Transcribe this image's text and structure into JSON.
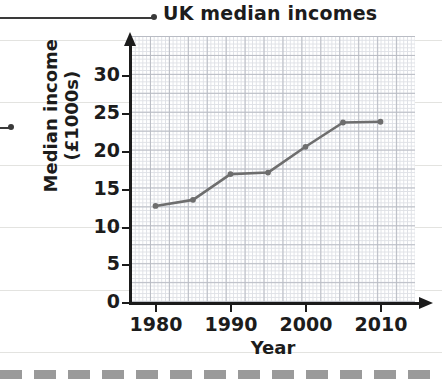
{
  "chart_data": {
    "type": "line",
    "title": "UK median incomes",
    "xlabel": "Year",
    "ylabel": "Median income (£1000s)",
    "ylabel_line1": "Median income",
    "ylabel_line2": "(£1000s)",
    "x": [
      1980,
      1985,
      1990,
      1995,
      2000,
      2005,
      2010
    ],
    "values": [
      12.8,
      13.6,
      17.0,
      17.2,
      20.6,
      23.8,
      23.9
    ],
    "xtick_labels": [
      "1980",
      "1990",
      "2000",
      "2010"
    ],
    "xtick_values": [
      1980,
      1990,
      2000,
      2010
    ],
    "ytick_labels": [
      "0",
      "5",
      "10",
      "15",
      "20",
      "25",
      "30"
    ],
    "ytick_values": [
      0,
      5,
      10,
      15,
      20,
      25,
      30
    ],
    "xlim": [
      1978,
      1991
    ],
    "ylim": [
      0,
      33
    ],
    "grid": true,
    "grid_minor": true,
    "legend": "none",
    "line_color": "#6e6e6e",
    "marker": "circle",
    "marker_color": "#6e6e6e"
  },
  "annotations": {
    "title_callout": "UK median incomes",
    "axis_callout": ""
  },
  "colors": {
    "axis": "#1b1b1b",
    "grid_major": "#b9bcc4",
    "grid_minor": "#dfe1e6",
    "page_rule": "#e3e3e0",
    "cut_line": "#9a9a9a",
    "series": "#6e6e6e"
  }
}
